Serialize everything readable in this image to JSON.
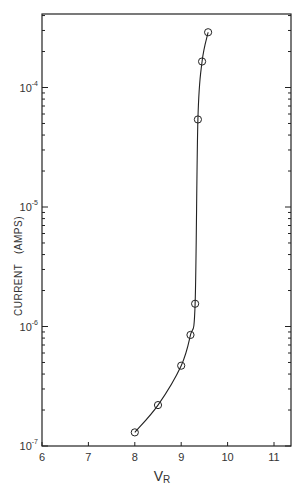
{
  "chart_data": {
    "type": "line",
    "title": "",
    "xlabel": "V",
    "xlabel_subscript": "R",
    "ylabel": "CURRENT   (AMPS)",
    "xlim": [
      6,
      11.4
    ],
    "ylim": [
      1e-07,
      0.0004
    ],
    "yscale": "log",
    "grid": false,
    "markers": "open-circle",
    "x_ticks": [
      6,
      7,
      8,
      9,
      10,
      11
    ],
    "x_tick_labels": [
      "6",
      "7",
      "8",
      "9",
      "10",
      "11"
    ],
    "y_ticks": [
      1e-07,
      1e-06,
      1e-05,
      0.0001
    ],
    "y_tick_labels": [
      {
        "base": "10",
        "exp": "-7"
      },
      {
        "base": "10",
        "exp": "-6"
      },
      {
        "base": "10",
        "exp": "-5"
      },
      {
        "base": "10",
        "exp": "-4"
      }
    ],
    "series": [
      {
        "name": "I-V curve",
        "x": [
          8.0,
          8.5,
          9.0,
          9.2,
          9.3,
          9.36,
          9.45,
          9.58
        ],
        "y": [
          1.3e-07,
          2.2e-07,
          4.7e-07,
          8.5e-07,
          1.55e-06,
          5.4e-05,
          0.000165,
          0.00029
        ]
      }
    ]
  }
}
